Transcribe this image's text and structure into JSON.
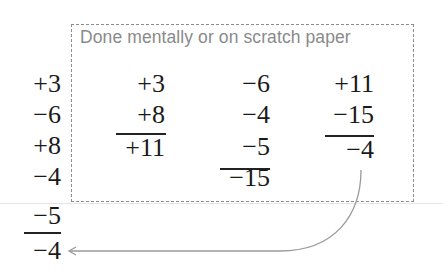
{
  "caption": "Done mentally or on scratch paper",
  "colors": {
    "digits": "#1a1a1a",
    "caption": "#8a8a8a",
    "box_border": "#8c8c8c",
    "arrow": "#9a9a9a"
  },
  "main_column": {
    "addends": [
      "+3",
      "−6",
      "+8",
      "−4",
      "−5"
    ],
    "result": "−4"
  },
  "scratch_columns": [
    {
      "addends": [
        "+3",
        "+8"
      ],
      "result": "+11"
    },
    {
      "addends": [
        "−6",
        "−4",
        "−5"
      ],
      "result": "−15"
    },
    {
      "addends": [
        "+11",
        "−15"
      ],
      "result": "−4"
    }
  ],
  "arrow": {
    "from": "scratch_columns.2.result",
    "to": "main_column.result",
    "icon": "curved-arrow-left"
  }
}
